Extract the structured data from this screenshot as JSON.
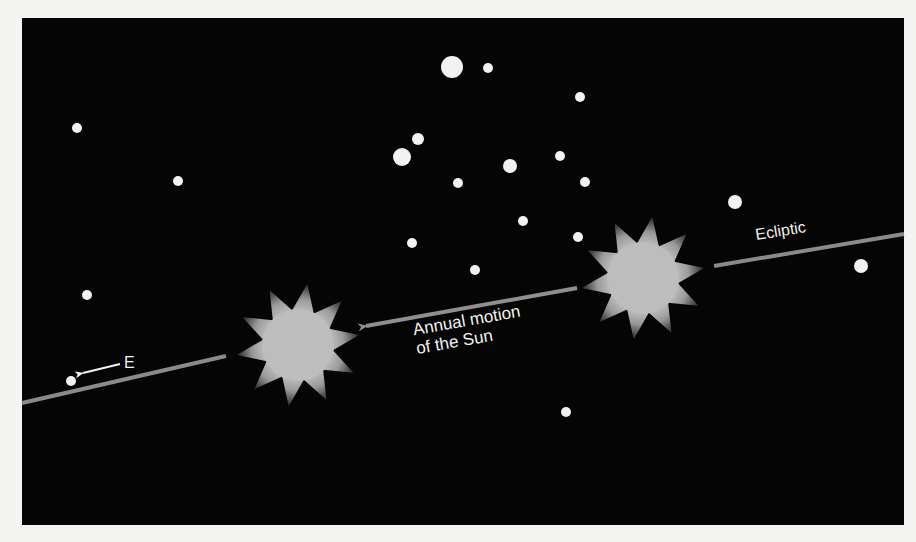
{
  "figure": {
    "labels": {
      "annual_motion_line1": "Annual motion",
      "annual_motion_line2": "of the Sun",
      "ecliptic": "Ecliptic",
      "east": "E"
    },
    "colors": {
      "page_background": "#f4f4f2",
      "sky": "#050505",
      "stars": "#f2f2f2",
      "ecliptic_line": "#8a8a8a",
      "sun": "#bdbdbd",
      "text": "#f2f2f2"
    },
    "stars": [
      {
        "x": 77,
        "y": 128,
        "r": 5
      },
      {
        "x": 178,
        "y": 181,
        "r": 5
      },
      {
        "x": 87,
        "y": 295,
        "r": 5
      },
      {
        "x": 71,
        "y": 381,
        "r": 5
      },
      {
        "x": 452,
        "y": 67,
        "r": 11
      },
      {
        "x": 488,
        "y": 68,
        "r": 5
      },
      {
        "x": 580,
        "y": 97,
        "r": 5
      },
      {
        "x": 418,
        "y": 139,
        "r": 6
      },
      {
        "x": 402,
        "y": 157,
        "r": 9
      },
      {
        "x": 510,
        "y": 166,
        "r": 7
      },
      {
        "x": 560,
        "y": 156,
        "r": 5
      },
      {
        "x": 458,
        "y": 183,
        "r": 5
      },
      {
        "x": 585,
        "y": 182,
        "r": 5
      },
      {
        "x": 523,
        "y": 221,
        "r": 5
      },
      {
        "x": 578,
        "y": 237,
        "r": 5
      },
      {
        "x": 412,
        "y": 243,
        "r": 5
      },
      {
        "x": 475,
        "y": 270,
        "r": 5
      },
      {
        "x": 735,
        "y": 202,
        "r": 7
      },
      {
        "x": 861,
        "y": 266,
        "r": 7
      },
      {
        "x": 566,
        "y": 412,
        "r": 5
      }
    ],
    "suns": [
      {
        "name": "sun-earlier",
        "cx": 643,
        "cy": 278,
        "core_r": 36,
        "ray_r": 62,
        "points": 10
      },
      {
        "name": "sun-later",
        "cx": 298,
        "cy": 345,
        "core_r": 36,
        "ray_r": 62,
        "points": 10
      }
    ],
    "ecliptic_segments": [
      {
        "x1": 22,
        "y1": 403,
        "x2": 226,
        "y2": 356
      },
      {
        "x1": 714,
        "y1": 266,
        "x2": 904,
        "y2": 234
      }
    ],
    "annual_motion_arrow": {
      "x1": 577,
      "y1": 288,
      "x2": 366,
      "y2": 326
    },
    "east_arrow": {
      "x1": 120,
      "y1": 364,
      "x2": 83,
      "y2": 373
    }
  }
}
